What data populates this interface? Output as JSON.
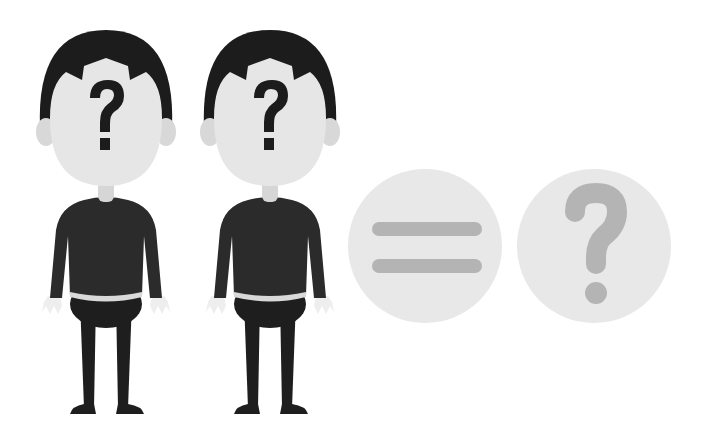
{
  "scene": {
    "description": "Two faceless cartoon men with question marks on their faces, followed by an equals sign and a question mark in circles",
    "background": "#ffffff"
  },
  "figures": [
    {
      "id": "person-1",
      "face_symbol": "?",
      "center_x": 106,
      "sweater_color": "#2b2b2b",
      "hair_color": "#1c1c1c",
      "skin_color": "#e6e6e6",
      "pants_color": "#1e1e1e",
      "symbol_color": "#1c1c1c"
    },
    {
      "id": "person-2",
      "face_symbol": "?",
      "center_x": 270,
      "sweater_color": "#555555",
      "hair_color": "#1c1c1c",
      "skin_color": "#e6e6e6",
      "pants_color": "#1e1e1e",
      "symbol_color": "#1c1c1c"
    }
  ],
  "badges": [
    {
      "id": "equals-badge",
      "symbol": "=",
      "cx": 425,
      "cy": 246,
      "r": 77,
      "fill": "#e8e8e8",
      "symbol_color": "#b4b4b4"
    },
    {
      "id": "question-badge",
      "symbol": "?",
      "cx": 594,
      "cy": 246,
      "r": 77,
      "fill": "#e8e8e8",
      "symbol_color": "#b4b4b4"
    }
  ]
}
